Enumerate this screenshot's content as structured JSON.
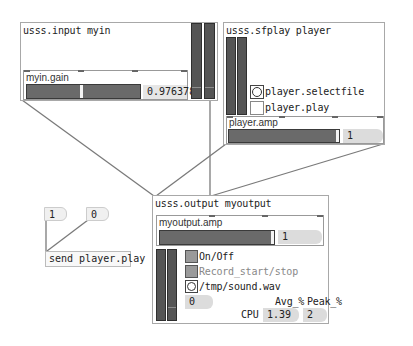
{
  "patcher": {
    "input_module": {
      "title": "usss.input myin",
      "gain_panel": {
        "label": "myin.gain",
        "value": "0.976378",
        "slider_position": 0.47
      }
    },
    "sfplay_module": {
      "title": "usss.sfplay player",
      "selectfile_label": "player.selectfile",
      "play_label": "player.play",
      "amp_panel": {
        "label": "player.amp",
        "value": "1"
      }
    },
    "output_module": {
      "title": "usss.output myoutput",
      "amp_panel": {
        "label": "myoutput.amp",
        "value": "1"
      },
      "onoff_label": "On/Off",
      "record_label": "Record_start/stop",
      "file_label": "/tmp/sound.wav",
      "level_value": "0",
      "cpu": {
        "label": "CPU",
        "avg_header": "Avg_%",
        "peak_header": "Peak_%",
        "avg_value": "1.39",
        "peak_value": "2"
      }
    },
    "number_boxes": [
      {
        "value": "1"
      },
      {
        "value": "0"
      }
    ],
    "send_message": {
      "text": "send player.play"
    }
  },
  "colors": {
    "cord": "#7a7a7a",
    "slider": "#6a6a6a",
    "meter": "#555555",
    "numbox_bg": "#dcdcdc",
    "border": "#a8a8a8"
  }
}
